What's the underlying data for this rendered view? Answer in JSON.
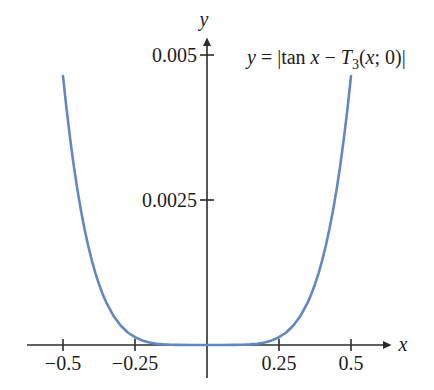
{
  "figure": {
    "axis_color": "#2b2b2b",
    "curve_color": "#6288c4",
    "y_axis_letter": "y",
    "x_axis_letter": "x",
    "y_tick_labels": [
      "0.005",
      "0.0025"
    ],
    "x_tick_labels": [
      "−0.5",
      "−0.25",
      "0.25",
      "0.5"
    ],
    "equation": {
      "p1": "y",
      "p2": " = |tan ",
      "p3": "x",
      "p4": " − ",
      "p5": "T",
      "p6": "3",
      "p7": "(",
      "p8": "x",
      "p9": "; 0)|"
    }
  },
  "chart_data": {
    "type": "line",
    "title": "y = |tan x − T3(x; 0)|",
    "xlabel": "x",
    "ylabel": "y",
    "xlim": [
      -0.62,
      0.64
    ],
    "ylim": [
      0,
      0.0053
    ],
    "x_ticks": [
      -0.5,
      -0.25,
      0.25,
      0.5
    ],
    "y_ticks": [
      0.0025,
      0.005
    ],
    "grid": false,
    "legend": "none",
    "series": [
      {
        "name": "absolute error of cubic Taylor polynomial of tan x at 0",
        "color": "#6288c4",
        "points": [
          [
            -0.5,
            0.004636
          ],
          [
            -0.4875,
            0.004062
          ],
          [
            -0.475,
            0.003548
          ],
          [
            -0.4625,
            0.003089
          ],
          [
            -0.45,
            0.00268
          ],
          [
            -0.4375,
            0.002317
          ],
          [
            -0.425,
            0.001995
          ],
          [
            -0.4125,
            0.00171
          ],
          [
            -0.4,
            0.00146
          ],
          [
            -0.3875,
            0.00124
          ],
          [
            -0.375,
            0.001048
          ],
          [
            -0.3625,
            0.000881
          ],
          [
            -0.35,
            0.000737
          ],
          [
            -0.325,
            0.000505
          ],
          [
            -0.3,
            0.000336
          ],
          [
            -0.275,
            0.000216
          ],
          [
            -0.25,
            0.000134
          ],
          [
            -0.225,
            7.85e-05
          ],
          [
            -0.2,
            4.34e-05
          ],
          [
            -0.175,
            2.19e-05
          ],
          [
            -0.15,
            1.02e-05
          ],
          [
            -0.125,
            4.1e-06
          ],
          [
            -0.1,
            1.3e-06
          ],
          [
            -0.05,
            4e-08
          ],
          [
            0,
            0
          ],
          [
            0.05,
            4e-08
          ],
          [
            0.1,
            1.3e-06
          ],
          [
            0.125,
            4.1e-06
          ],
          [
            0.15,
            1.02e-05
          ],
          [
            0.175,
            2.19e-05
          ],
          [
            0.2,
            4.34e-05
          ],
          [
            0.225,
            7.85e-05
          ],
          [
            0.25,
            0.000134
          ],
          [
            0.275,
            0.000216
          ],
          [
            0.3,
            0.000336
          ],
          [
            0.325,
            0.000505
          ],
          [
            0.35,
            0.000737
          ],
          [
            0.3625,
            0.000881
          ],
          [
            0.375,
            0.001048
          ],
          [
            0.3875,
            0.00124
          ],
          [
            0.4,
            0.00146
          ],
          [
            0.4125,
            0.00171
          ],
          [
            0.425,
            0.001995
          ],
          [
            0.4375,
            0.002317
          ],
          [
            0.45,
            0.00268
          ],
          [
            0.4625,
            0.003089
          ],
          [
            0.475,
            0.003548
          ],
          [
            0.4875,
            0.004062
          ],
          [
            0.5,
            0.004636
          ]
        ]
      }
    ]
  }
}
